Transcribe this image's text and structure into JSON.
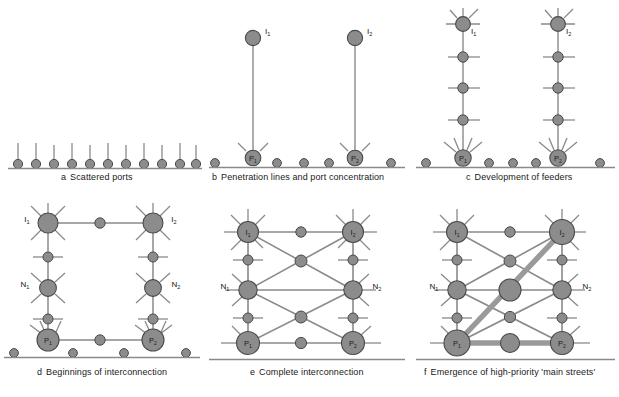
{
  "figure": {
    "type": "diagram",
    "background": "#ffffff",
    "colors": {
      "node_fill": "#8c8c8c",
      "node_stroke": "#4a4a4a",
      "link": "#8a8a8a",
      "baseline": "#8a8a8a",
      "main_street": "#9a9a9a",
      "text": "#1a1a1a"
    }
  },
  "panels": [
    {
      "id": "a",
      "letter": "a",
      "caption": "Scattered ports",
      "caption_full": "a  Scattered ports",
      "description": "Eleven small scattered ports along the coastline, each with a short inland stem",
      "port_count": 11,
      "node_labels": []
    },
    {
      "id": "b",
      "letter": "b",
      "caption": "Penetration lines and port concentration",
      "caption_full": "b  Penetration lines and port concentration",
      "description": "Two ports concentrate and send long penetration lines inland to interior centres",
      "port_count": 6,
      "node_labels": [
        "I1",
        "I2",
        "P1",
        "P2"
      ]
    },
    {
      "id": "c",
      "letter": "c",
      "caption": "Development of feeders",
      "caption_full": "c  Development of feeders",
      "description": "Feeder routes develop along the penetration lines at intermediate nodes",
      "port_count": 6,
      "node_labels": [
        "I1",
        "I2",
        "P1",
        "P2"
      ]
    },
    {
      "id": "d",
      "letter": "d",
      "caption": "Beginnings of interconnection",
      "caption_full": "d  Beginnings of interconnection",
      "description": "Lateral links begin to join the two corridors; intermediate centres N1 and N2 appear",
      "port_count": 6,
      "node_labels": [
        "I1",
        "I2",
        "N1",
        "N2",
        "P1",
        "P2"
      ]
    },
    {
      "id": "e",
      "letter": "e",
      "caption": "Complete interconnection",
      "caption_full": "e  Complete interconnection",
      "description": "A full lattice of interconnecting routes links all nodes",
      "port_count": 0,
      "node_labels": [
        "I1",
        "I2",
        "N1",
        "N2",
        "P1",
        "P2"
      ]
    },
    {
      "id": "f",
      "letter": "f",
      "caption": "Emergence of high-priority 'main streets'",
      "caption_full": "f  Emergence of high-priority 'main streets'",
      "description": "Selected high-priority routes thicken into main streets: P1-I2 diagonal and P1-P2 coastal trunk",
      "port_count": 0,
      "node_labels": [
        "I1",
        "I2",
        "N1",
        "N2",
        "P1",
        "P2"
      ],
      "main_streets": [
        "P1 to I2",
        "P1 to P2"
      ]
    }
  ],
  "node_label_text": {
    "I1": {
      "base": "I",
      "sub": "1"
    },
    "I2": {
      "base": "I",
      "sub": "2"
    },
    "N1": {
      "base": "N",
      "sub": "1"
    },
    "N2": {
      "base": "N",
      "sub": "2"
    },
    "P1": {
      "base": "P",
      "sub": "1"
    },
    "P2": {
      "base": "P",
      "sub": "2"
    }
  }
}
